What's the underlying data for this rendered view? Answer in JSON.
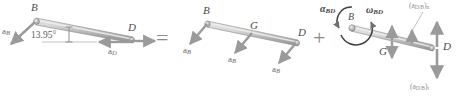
{
  "figure": {
    "type": "relative-acceleration-vector-diagram",
    "equation_operators": {
      "equals": "=",
      "plus": "+"
    },
    "colors": {
      "bar_fill": "#c9c9c9",
      "bar_edge": "#8c8c8c",
      "arrow": "#9a9a9a",
      "text": "#5b5b5b",
      "background": "#ffffff"
    }
  },
  "panel_left": {
    "name": "absolute-accelerations-of-bar-BD",
    "points": {
      "b": "B",
      "d": "D"
    },
    "angle": {
      "value": "13.95°"
    },
    "vectors": [
      {
        "id": "a-b",
        "label": "a",
        "sub": "B"
      },
      {
        "id": "a-d",
        "label": "a",
        "sub": "D"
      }
    ]
  },
  "panel_middle": {
    "name": "translation-component",
    "points": {
      "b": "B",
      "g": "G",
      "d": "D"
    },
    "vectors": [
      {
        "id": "a-b-1",
        "label": "a",
        "sub": "B"
      },
      {
        "id": "a-b-2",
        "label": "a",
        "sub": "B"
      },
      {
        "id": "a-b-3",
        "label": "a",
        "sub": "B"
      }
    ]
  },
  "panel_right": {
    "name": "rotation-component",
    "points": {
      "b": "B",
      "g": "G",
      "d": "D"
    },
    "alpha": {
      "label": "α",
      "sub": "BD"
    },
    "omega": {
      "label": "ω",
      "sub": "BD"
    },
    "components": [
      {
        "id": "a-db-n",
        "label": "(a",
        "sub": "D/B",
        "close": ")",
        "comp": "n"
      },
      {
        "id": "a-db-t",
        "label": "(a",
        "sub": "D/B",
        "close": ")",
        "comp": "t"
      }
    ]
  }
}
